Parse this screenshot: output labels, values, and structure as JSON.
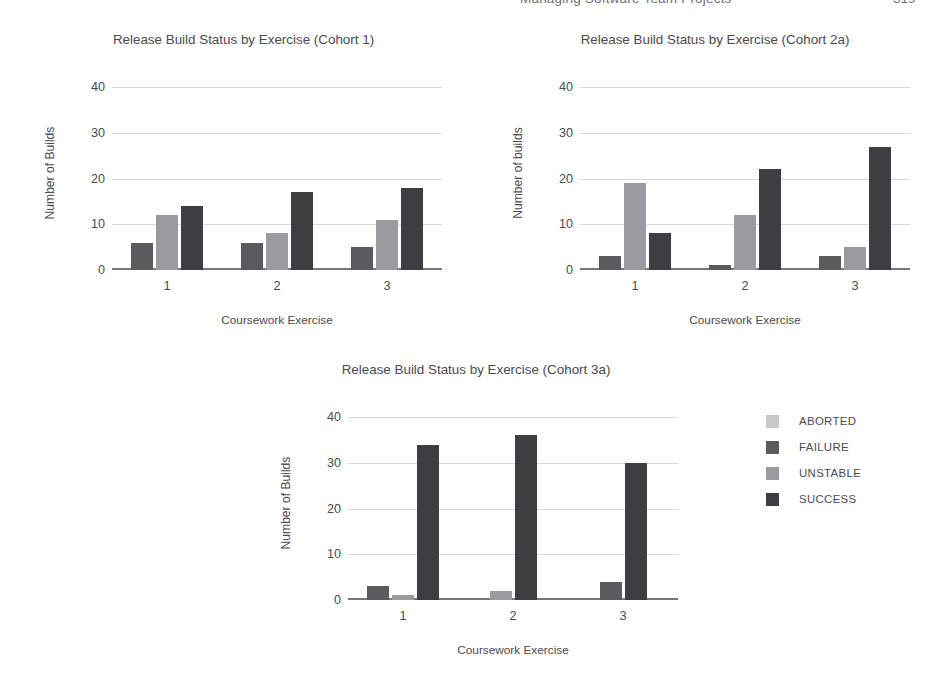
{
  "page_header": {
    "running_head": "Managing Software Team Projects",
    "folio": "319"
  },
  "legend": {
    "position": "right",
    "items": [
      {
        "label": "ABORTED",
        "color": "#c9c9cc"
      },
      {
        "label": "FAILURE",
        "color": "#5a5a5f"
      },
      {
        "label": "UNSTABLE",
        "color": "#9a9aa0"
      },
      {
        "label": "SUCCESS",
        "color": "#3d3d42"
      }
    ]
  },
  "chart_data": [
    {
      "type": "bar",
      "id": "cohort1",
      "title": "Release Build Status by Exercise (Cohort 1)",
      "xlabel": "Coursework Exercise",
      "ylabel": "Number of Builds",
      "categories": [
        "1",
        "2",
        "3"
      ],
      "yticks": [
        0,
        10,
        20,
        30,
        40
      ],
      "ylim": [
        0,
        42
      ],
      "grid": true,
      "legend_position": "shared-right",
      "series": [
        {
          "name": "ABORTED",
          "color": "#c9c9cc",
          "values": [
            0,
            0,
            0
          ]
        },
        {
          "name": "FAILURE",
          "color": "#5a5a5f",
          "values": [
            6,
            6,
            5
          ]
        },
        {
          "name": "UNSTABLE",
          "color": "#9a9aa0",
          "values": [
            12,
            8,
            11
          ]
        },
        {
          "name": "SUCCESS",
          "color": "#3d3d42",
          "values": [
            14,
            17,
            18
          ]
        }
      ]
    },
    {
      "type": "bar",
      "id": "cohort2a",
      "title": "Release Build Status by Exercise (Cohort 2a)",
      "xlabel": "Coursework Exercise",
      "ylabel": "Number of builds",
      "categories": [
        "1",
        "2",
        "3"
      ],
      "yticks": [
        0,
        10,
        20,
        30,
        40
      ],
      "ylim": [
        0,
        42
      ],
      "grid": true,
      "legend_position": "shared-right",
      "series": [
        {
          "name": "ABORTED",
          "color": "#c9c9cc",
          "values": [
            0,
            0,
            0
          ]
        },
        {
          "name": "FAILURE",
          "color": "#5a5a5f",
          "values": [
            3,
            1,
            3
          ]
        },
        {
          "name": "UNSTABLE",
          "color": "#9a9aa0",
          "values": [
            19,
            12,
            5
          ]
        },
        {
          "name": "SUCCESS",
          "color": "#3d3d42",
          "values": [
            8,
            22,
            27
          ]
        }
      ]
    },
    {
      "type": "bar",
      "id": "cohort3a",
      "title": "Release Build Status by Exercise (Cohort 3a)",
      "xlabel": "Coursework Exercise",
      "ylabel": "Number of Builds",
      "categories": [
        "1",
        "2",
        "3"
      ],
      "yticks": [
        0,
        10,
        20,
        30,
        40
      ],
      "ylim": [
        0,
        42
      ],
      "grid": true,
      "legend_position": "right",
      "series": [
        {
          "name": "ABORTED",
          "color": "#c9c9cc",
          "values": [
            0,
            0,
            0
          ]
        },
        {
          "name": "FAILURE",
          "color": "#5a5a5f",
          "values": [
            3,
            0,
            4
          ]
        },
        {
          "name": "UNSTABLE",
          "color": "#9a9aa0",
          "values": [
            1,
            2,
            0
          ]
        },
        {
          "name": "SUCCESS",
          "color": "#3d3d42",
          "values": [
            34,
            36,
            30
          ]
        }
      ]
    }
  ]
}
